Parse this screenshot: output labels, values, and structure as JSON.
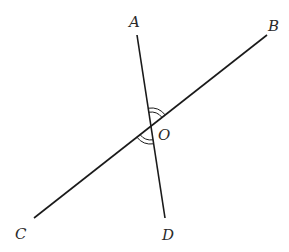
{
  "diagram": {
    "type": "intersecting-lines",
    "points": {
      "A": {
        "label": "A",
        "x": 137,
        "y": 35,
        "label_x": 129,
        "label_y": 27
      },
      "B": {
        "label": "B",
        "x": 267,
        "y": 35,
        "label_x": 268,
        "label_y": 31
      },
      "C": {
        "label": "C",
        "x": 34,
        "y": 218,
        "label_x": 15,
        "label_y": 239
      },
      "D": {
        "label": "D",
        "x": 165,
        "y": 218,
        "label_x": 162,
        "label_y": 240
      },
      "O": {
        "label": "O",
        "x": 151,
        "y": 126,
        "label_x": 158,
        "label_y": 140
      }
    },
    "lines": [
      {
        "name": "AD",
        "from": "A",
        "to": "D"
      },
      {
        "name": "CB",
        "from": "C",
        "to": "B"
      }
    ],
    "angle_marks": [
      {
        "name": "angle-AOB",
        "arcs": 2
      },
      {
        "name": "angle-COD",
        "arcs": 2
      }
    ],
    "stroke_color": "#1a1a1a",
    "label_color": "#2a2a2a"
  }
}
